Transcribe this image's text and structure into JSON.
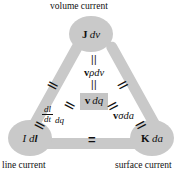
{
  "diagram": {
    "title_top": "volume current",
    "title_left": "line current",
    "title_right": "surface current",
    "colors": {
      "edge": "#c9c9c9",
      "node": "#c9c9c9",
      "highlight_box": "#c4c4c4",
      "text": "#111111",
      "background": "#ffffff"
    },
    "nodes": {
      "top": {
        "bold_part": "J",
        "italic_part": "dv",
        "caption": "volume current"
      },
      "left": {
        "italic_part": "I d",
        "bold_part": "l",
        "caption": "line current"
      },
      "right": {
        "bold_part": "K",
        "italic_part": "da",
        "caption": "surface current"
      }
    },
    "center_chain": {
      "rel_1": "||",
      "term_1_bold": "v",
      "term_1_rho": "ρ",
      "term_1_italic": "dv",
      "rel_2": "||",
      "boxed_bold": "v",
      "boxed_italic": "dq"
    },
    "lower_left_term": {
      "numerator": "dl",
      "denominator": "dt",
      "trailing": "dq",
      "rel_above": "||",
      "rel_below": "||"
    },
    "lower_right_term": {
      "bold": "v",
      "sigma": "σ",
      "italic": "da",
      "rel_above": "||",
      "rel_below": "||"
    },
    "edge_relations": {
      "left_edge": "||",
      "right_edge": "||",
      "bottom_edge": "="
    }
  }
}
